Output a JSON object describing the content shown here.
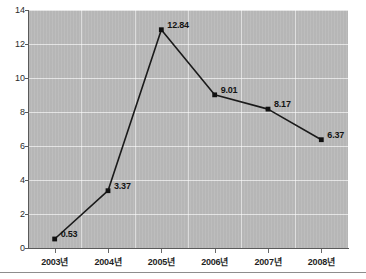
{
  "chart_data": {
    "type": "line",
    "title": "",
    "subtitle": "",
    "xlabel": "",
    "ylabel": "",
    "categories": [
      "2003년",
      "2004년",
      "2005년",
      "2006년",
      "2007년",
      "2008년"
    ],
    "values": [
      0.53,
      3.37,
      12.84,
      9.01,
      8.17,
      6.37
    ],
    "point_labels": [
      "0.53",
      "3.37",
      "12.84",
      "9.01",
      "8.17",
      "6.37"
    ],
    "ylim": [
      0,
      14
    ],
    "ytick_values": [
      0,
      2,
      4,
      6,
      8,
      10,
      12,
      14
    ],
    "ytick_labels": [
      "0",
      "2",
      "4",
      "6",
      "8",
      "10",
      "12",
      "14"
    ],
    "grid": true,
    "legend": false,
    "legend_position": "none",
    "series": [
      {
        "name": "",
        "values": [
          0.53,
          3.37,
          12.84,
          9.01,
          8.17,
          6.37
        ]
      }
    ],
    "colors": {
      "plot_background": "#b9b9b9",
      "line": "#1a1a1a",
      "marker": "#111111",
      "gridline": "#ffffff",
      "axis": "#5a5a5a",
      "label_text": "#141414",
      "page_background": "#ffffff"
    }
  }
}
